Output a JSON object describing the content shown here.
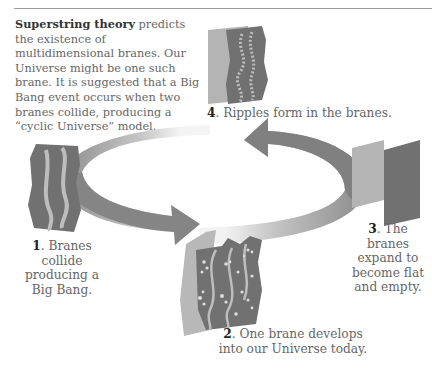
{
  "intro": {
    "bold": "Superstring theory",
    "text": " predicts the existence of multidimensional branes. Our Universe might be one such brane. It is suggested that a Big Bang event occurs when two branes collide, producing a “cyclic Universe” model."
  },
  "steps": [
    {
      "num": "1",
      "text": ". Branes collide producing a Big Bang."
    },
    {
      "num": "2",
      "text": ". One brane develops into our Universe today."
    },
    {
      "num": "3",
      "text": ". The branes expand to become flat and empty."
    },
    {
      "num": "4",
      "text": ". Ripples form in the branes."
    }
  ],
  "colors": {
    "dark_brane": "#717171",
    "light_brane": "#b4b4b4",
    "ripple": "#bdbdbd",
    "arrow": "#8a8a8a"
  }
}
